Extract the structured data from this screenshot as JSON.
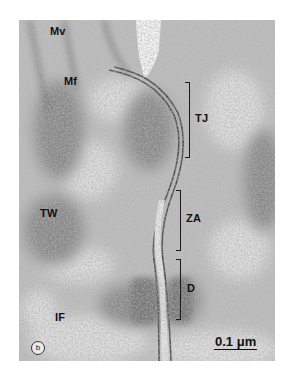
{
  "figure": {
    "panel_label": "b",
    "scale_bar": "0.1 μm",
    "labels": {
      "mv": "Mv",
      "mf": "Mf",
      "tw": "TW",
      "if": "IF",
      "tj": "TJ",
      "za": "ZA",
      "d": "D"
    },
    "colors": {
      "background": "#ffffff",
      "cytoplasm": "#b9b9b9",
      "dense": "#6e6e6e",
      "membrane": "#4a4a4a",
      "light": "#e6e6e6"
    }
  }
}
